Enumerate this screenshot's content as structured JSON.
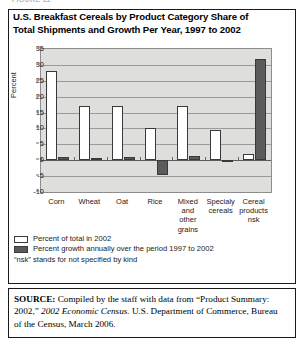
{
  "figure_stub": "FIGURE 11",
  "title": "U.S. Breakfast Cereals by Product Category Share of Total Shipments and Growth Per Year, 1997 to 2002",
  "axis": {
    "ylabel": "Percent"
  },
  "legend": {
    "share_label": "Percent of total in 2002",
    "growth_label": "Percent growth annually over the period 1997 to 2002",
    "note": "“nsk” stands for not specified by kind"
  },
  "source": {
    "label": "SOURCE:",
    "part1": " Compiled by the staff with data from “Product Summary: 2002,” ",
    "italic": "2002 Economic Census.",
    "part2": " U.S. Department of Commerce, Bureau of the Census, March 2006."
  },
  "chart_data": {
    "type": "bar",
    "title": "U.S. Breakfast Cereals by Product Category Share of Total Shipments and Growth Per Year, 1997 to 2002",
    "xlabel": "",
    "ylabel": "Percent",
    "ylim": [
      -10,
      35
    ],
    "ytick_step": 5,
    "yticks": [
      35,
      30,
      25,
      20,
      15,
      10,
      5,
      0,
      -5,
      -10
    ],
    "ytick_labels": [
      "35",
      "30",
      "25",
      "20",
      "15",
      "10",
      "5",
      "0",
      "-5",
      "-10"
    ],
    "grid": true,
    "grid_axis": "y",
    "legend_position": "below-left",
    "categories": [
      "Corn",
      "Wheat",
      "Oat",
      "Rice",
      "Mixed and other grains",
      "Specialy cereals",
      "Cereal products nsk"
    ],
    "category_labels": [
      "Corn",
      "Wheat",
      "Oat",
      "Rice",
      "Mixed\nand\nother\ngrains",
      "Specialy\ncereals",
      "Cereal\nproducts\nnsk"
    ],
    "series": [
      {
        "name": "Percent of total in 2002",
        "color": "#ffffff",
        "values": [
          28,
          17,
          17,
          10,
          17,
          9.5,
          2
        ]
      },
      {
        "name": "Percent growth annually over the period 1997 to 2002",
        "color": "#5b5b5b",
        "values": [
          1,
          0.7,
          1,
          -4.5,
          1.2,
          0.2,
          32
        ]
      }
    ]
  }
}
